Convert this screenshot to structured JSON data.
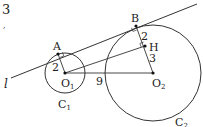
{
  "problem_number": "3",
  "stray_mark": ",",
  "line_label": "l",
  "points": {
    "A": {
      "label": "A",
      "x": 58,
      "y": 54
    },
    "B": {
      "label": "B",
      "x": 136,
      "y": 26
    },
    "H": {
      "label": "H",
      "x": 145,
      "y": 46
    },
    "O1": {
      "label": "O",
      "sub": "1",
      "x": 65,
      "y": 73
    },
    "O2": {
      "label": "O",
      "sub": "2",
      "x": 153,
      "y": 73
    }
  },
  "circles": {
    "C1": {
      "label": "C",
      "sub": "1",
      "cx": 65,
      "cy": 73,
      "r": 20
    },
    "C2": {
      "label": "C",
      "sub": "2",
      "cx": 153,
      "cy": 73,
      "r": 48
    }
  },
  "lengths": {
    "AO1": "2",
    "BH": "2",
    "HO2": "3",
    "O1O2": "9"
  },
  "colors": {
    "stroke": "#333333",
    "text": "#222222",
    "background": "#ffffff"
  }
}
